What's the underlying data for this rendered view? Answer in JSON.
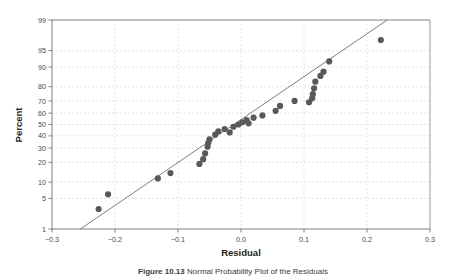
{
  "figure": {
    "caption_label": "Figure 10.13",
    "caption_text": "Normal Probability Plot of the Residuals"
  },
  "chart_data": {
    "type": "scatter",
    "title": "",
    "subtitle": "",
    "xlabel": "Residual",
    "ylabel": "Percent",
    "xlim": [
      -0.3,
      0.3
    ],
    "ylim": [
      1,
      99
    ],
    "yscale": "normal-probability",
    "grid": true,
    "legend": "none",
    "xticks": [
      "-0.3",
      "-0.2",
      "-0.1",
      "0.0",
      "0.1",
      "0.2",
      "0.3"
    ],
    "xtick_values": [
      -0.3,
      -0.2,
      -0.1,
      0.0,
      0.1,
      0.2,
      0.3
    ],
    "yticks": [
      "1",
      "5",
      "10",
      "20",
      "30",
      "40",
      "50",
      "60",
      "70",
      "80",
      "90",
      "95",
      "99"
    ],
    "ytick_values": [
      1,
      5,
      10,
      20,
      30,
      40,
      50,
      60,
      70,
      80,
      90,
      95,
      99
    ],
    "marker_color": "#58595b",
    "line_color": "#6d6e71",
    "grid_color": "#d8d8d8",
    "frame_color": "#808080",
    "reference_line": {
      "label": "fitted normal line",
      "x1": -0.255,
      "y1": 1,
      "x2": 0.232,
      "y2": 99
    },
    "points": [
      {
        "x": -0.226,
        "y": 3.0
      },
      {
        "x": -0.211,
        "y": 6.0
      },
      {
        "x": -0.132,
        "y": 11.5
      },
      {
        "x": -0.112,
        "y": 14.0
      },
      {
        "x": -0.066,
        "y": 19.0
      },
      {
        "x": -0.06,
        "y": 22.0
      },
      {
        "x": -0.057,
        "y": 26.0
      },
      {
        "x": -0.053,
        "y": 31.0
      },
      {
        "x": -0.052,
        "y": 34.0
      },
      {
        "x": -0.05,
        "y": 37.0
      },
      {
        "x": -0.041,
        "y": 41.0
      },
      {
        "x": -0.036,
        "y": 44.0
      },
      {
        "x": -0.026,
        "y": 46.0
      },
      {
        "x": -0.018,
        "y": 43.0
      },
      {
        "x": -0.012,
        "y": 48.0
      },
      {
        "x": -0.004,
        "y": 50.0
      },
      {
        "x": 0.002,
        "y": 52.0
      },
      {
        "x": 0.009,
        "y": 54.0
      },
      {
        "x": 0.012,
        "y": 51.0
      },
      {
        "x": 0.02,
        "y": 56.0
      },
      {
        "x": 0.034,
        "y": 58.0
      },
      {
        "x": 0.055,
        "y": 62.0
      },
      {
        "x": 0.062,
        "y": 66.0
      },
      {
        "x": 0.085,
        "y": 70.0
      },
      {
        "x": 0.108,
        "y": 69.0
      },
      {
        "x": 0.113,
        "y": 72.0
      },
      {
        "x": 0.114,
        "y": 75.0
      },
      {
        "x": 0.116,
        "y": 79.0
      },
      {
        "x": 0.118,
        "y": 83.0
      },
      {
        "x": 0.126,
        "y": 86.0
      },
      {
        "x": 0.131,
        "y": 88.0
      },
      {
        "x": 0.14,
        "y": 92.0
      },
      {
        "x": 0.222,
        "y": 97.0
      }
    ]
  }
}
